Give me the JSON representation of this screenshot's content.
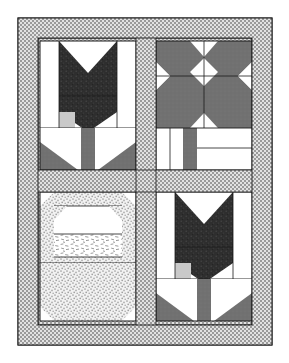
{
  "document": {
    "title": "Quilt Block Layout Diagram",
    "kind": "quilt-pattern-illustration",
    "canvas": {
      "width": 289,
      "height": 363,
      "background": "#ffffff"
    }
  },
  "palette": {
    "background": "#ffffff",
    "fabric_white": "#ffffff",
    "fabric_light_gray": "#c9c9c9",
    "fabric_medium_gray": "#6f6f6f",
    "fabric_dark": "#2f2f2f",
    "fabric_checkered_light": "#e0e0e0",
    "fabric_checkered_dark": "#9a9a9a",
    "fabric_stipple_light": "#efefef",
    "fabric_stipple_dot": "#9a9a9a",
    "outline": "#1a1a1a"
  },
  "quilt": {
    "geometry": {
      "left": 18,
      "top": 18,
      "right": 272,
      "bottom": 345,
      "outer_border_width": 20,
      "sash_width": 17,
      "column_split_x": 146,
      "row_split_y": 181
    },
    "border": {
      "name": "outer-border",
      "fabric": "checkered-gray",
      "label": "Checkered Border"
    },
    "sashing": {
      "name": "sashing",
      "fabric": "checkered-gray",
      "label": "Checkered Sashing"
    },
    "blocks": [
      {
        "id": "block-top-left",
        "position": "top-left",
        "pattern": "tulip",
        "label": "Tulip Block",
        "fabrics": [
          "fabric_dark",
          "fabric_medium_gray",
          "fabric_light_gray",
          "fabric_white"
        ],
        "bounds": {
          "x": 40,
          "y": 41,
          "w": 96,
          "h": 129
        }
      },
      {
        "id": "block-top-right",
        "position": "top-right",
        "pattern": "star",
        "label": "Star Block",
        "fabrics": [
          "fabric_medium_gray",
          "fabric_white"
        ],
        "bounds": {
          "x": 156,
          "y": 41,
          "w": 96,
          "h": 129
        }
      },
      {
        "id": "block-bottom-left",
        "position": "bottom-left",
        "pattern": "basket",
        "label": "Basket Block",
        "fabrics": [
          "fabric_stipple_light",
          "fabric_white"
        ],
        "bounds": {
          "x": 40,
          "y": 192,
          "w": 96,
          "h": 129
        }
      },
      {
        "id": "block-bottom-right",
        "position": "bottom-right",
        "pattern": "tulip",
        "label": "Tulip Block",
        "fabrics": [
          "fabric_dark",
          "fabric_medium_gray",
          "fabric_light_gray",
          "fabric_white"
        ],
        "bounds": {
          "x": 156,
          "y": 192,
          "w": 96,
          "h": 129
        }
      }
    ]
  }
}
